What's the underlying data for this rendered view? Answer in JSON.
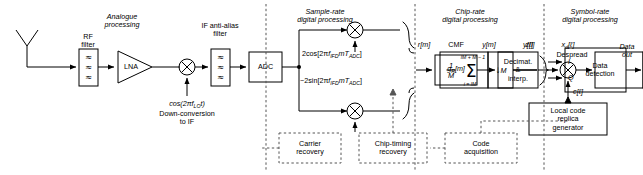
{
  "diagram": {
    "stage_headings": [
      {
        "id": "analogue",
        "line1": "Analogue",
        "line2": "processing"
      },
      {
        "id": "sample-rate",
        "line1": "Sample-rate",
        "line2": "digital processing"
      },
      {
        "id": "chip-rate",
        "line1": "Chip-rate",
        "line2": "digital processing"
      },
      {
        "id": "symbol-rate",
        "line1": "Symbol-rate",
        "line2": "digital processing"
      }
    ],
    "blocks": {
      "rf_filter": {
        "label_line1": "RF",
        "label_line2": "filter",
        "glyph": "≈"
      },
      "lna": {
        "label": "LNA"
      },
      "if_filter": {
        "label_line1": "IF anti-alias",
        "label_line2": "filter",
        "glyph": "≈"
      },
      "adc": {
        "label": "ADC"
      },
      "cmf": {
        "heading": "CMF",
        "label": "g",
        "label_sub": "R",
        "label_idx": "[m]"
      },
      "decimator": {
        "line1": "Decimat.",
        "line2": "&",
        "line3": "interp."
      },
      "accumulator": {
        "frac_num": "1",
        "frac_den": "M",
        "sigma": "Σ",
        "upper_limit": "lM + M − 1",
        "lower_limit": "i = lM"
      },
      "downsample": {
        "label": "M",
        "arrow": "↓"
      },
      "data_detection": {
        "line1": "Data",
        "line2": "detection",
        "input_i": "I",
        "input_q": "Q"
      },
      "local_code": {
        "line1": "Local code",
        "line2": "replica",
        "line3": "generator"
      }
    },
    "dashed_blocks": [
      {
        "id": "carrier-recovery",
        "line1": "Carrier",
        "line2": "recovery"
      },
      {
        "id": "chip-timing-recovery",
        "line1": "Chip-timing",
        "line2": "recovery"
      },
      {
        "id": "code-acquisition",
        "line1": "Code",
        "line2": "acquisition"
      }
    ],
    "annotations": {
      "lo_expr": "cos(2πf",
      "lo_expr_sub": "LO",
      "lo_expr_end": "t)",
      "downconv_line1": "Down-conversion",
      "downconv_line2": "to IF",
      "cos_expr_a": "2cos[2π",
      "cos_expr_f": "f",
      "cos_expr_sub": "IFD",
      "cos_expr_m": "mT",
      "cos_expr_sub2": "ADC",
      "cos_expr_end": "]",
      "sin_expr_a": "−2sin[2π",
      "sin_expr_f": "f",
      "sin_expr_sub": "IFD",
      "sin_expr_m": "mT",
      "sin_expr_sub2": "ADC",
      "sin_expr_end": "]",
      "despread": "Despread",
      "data_out_line1": "Data",
      "data_out_line2": "out"
    },
    "signals": [
      {
        "id": "r-m",
        "text": "r[m]"
      },
      {
        "id": "y-m",
        "text": "y[m]"
      },
      {
        "id": "y-l",
        "text": "y[ℓ]"
      },
      {
        "id": "xd-l",
        "text": "x",
        "sub": "d",
        "idx": "[ℓ]"
      },
      {
        "id": "c-l",
        "text": "c[ℓ]"
      },
      {
        "id": "z-l",
        "text": "z[l]"
      }
    ],
    "colors": {
      "stroke": "#000000",
      "background": "#ffffff",
      "dashed": "#555555"
    }
  }
}
